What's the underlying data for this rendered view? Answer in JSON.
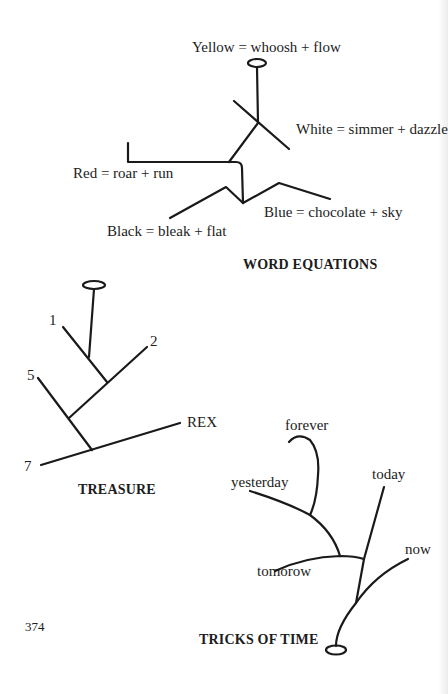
{
  "page": {
    "page_number": "374"
  },
  "word_equations": {
    "caption": "WORD EQUATIONS",
    "labels": {
      "yellow": "Yellow = whoosh + flow",
      "white": "White = simmer + dazzle",
      "red": "Red = roar + run",
      "blue": "Blue = chocolate + sky",
      "black": "Black = bleak + flat"
    }
  },
  "treasure": {
    "caption": "TREASURE",
    "labels": {
      "one": "1",
      "two": "2",
      "five": "5",
      "seven": "7",
      "rex": "REX"
    }
  },
  "tricks_of_time": {
    "caption": "TRICKS OF TIME",
    "labels": {
      "forever": "forever",
      "yesterday": "yesterday",
      "today": "today",
      "now": "now",
      "tomorow": "tomorow"
    }
  },
  "colors": {
    "ink": "#1a1a1a",
    "paper": "#ffffff"
  }
}
